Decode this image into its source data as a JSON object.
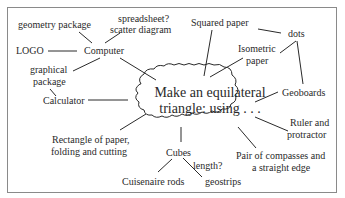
{
  "diagram": {
    "central_node": {
      "line1": "Make an equilateral",
      "line2": "triangle: using . . ."
    },
    "nodes": {
      "geometry_package": "geometry package",
      "spreadsheet": "spreadsheet?",
      "scatter_diagram": "scatter diagram",
      "logo": "LOGO",
      "computer": "Computer",
      "graphical": "graphical",
      "package": "package",
      "calculator": "Calculator",
      "rectangle_line1": "Rectangle of paper,",
      "rectangle_line2": "folding and cutting",
      "cubes": "Cubes",
      "length": "length?",
      "cuisenaire": "Cuisenaire rods",
      "geostrips": "geostrips",
      "compasses_line1": "Pair of compasses and",
      "compasses_line2": "a straight edge",
      "ruler_line1": "Ruler and",
      "ruler_line2": "protractor",
      "geoboards": "Geoboards",
      "squared_paper": "Squared paper",
      "dots": "dots",
      "isometric": "Isometric",
      "paper": "paper"
    },
    "colors": {
      "line": "#2a2a2a",
      "border": "#8a8a8a",
      "text": "#2a2a2a",
      "background": "#ffffff"
    }
  }
}
